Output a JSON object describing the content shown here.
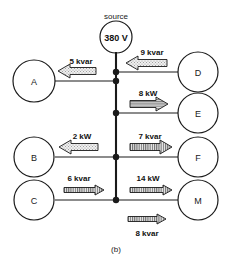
{
  "figure": {
    "caption": "(b)",
    "source": {
      "name": "source",
      "voltage": "380 V"
    },
    "nodes": [
      {
        "id": "A",
        "label": "A",
        "side": "left"
      },
      {
        "id": "B",
        "label": "B",
        "side": "left"
      },
      {
        "id": "C",
        "label": "C",
        "side": "left"
      },
      {
        "id": "D",
        "label": "D",
        "side": "right"
      },
      {
        "id": "E",
        "label": "E",
        "side": "right"
      },
      {
        "id": "F",
        "label": "F",
        "side": "right"
      },
      {
        "id": "M",
        "label": "M",
        "side": "right"
      }
    ],
    "flows": [
      {
        "id": "flow-a",
        "label": "5 kvar",
        "direction": "left",
        "branch": "A"
      },
      {
        "id": "flow-d",
        "label": "9 kvar",
        "direction": "left",
        "branch": "D"
      },
      {
        "id": "flow-e",
        "label": "8 kW",
        "direction": "right",
        "branch": "E"
      },
      {
        "id": "flow-b",
        "label": "2 kW",
        "direction": "left",
        "branch": "B"
      },
      {
        "id": "flow-f",
        "label": "7 kvar",
        "direction": "right",
        "branch": "F"
      },
      {
        "id": "flow-c",
        "label": "6 kvar",
        "direction": "right",
        "branch": "C"
      },
      {
        "id": "flow-m1",
        "label": "14 kW",
        "direction": "right",
        "branch": "M"
      },
      {
        "id": "flow-m2",
        "label": "8 kvar",
        "direction": "right",
        "branch": "M"
      }
    ]
  },
  "colors": {
    "line": "#1a1a1a",
    "background": "#ffffff",
    "arrow_fill": "#bfbfbf",
    "source_fill": "#b5b5b5"
  }
}
